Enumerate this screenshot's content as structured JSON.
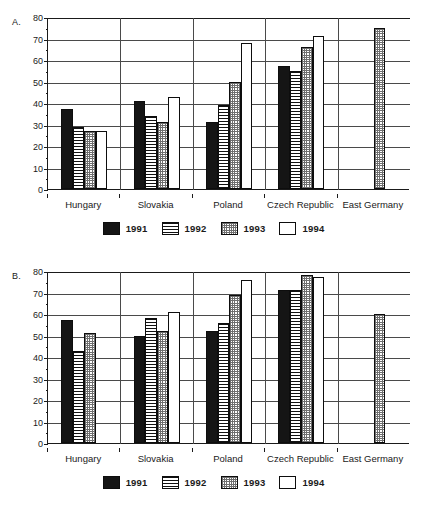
{
  "figure": {
    "background": "#ffffff",
    "panels": [
      {
        "label": "A.",
        "name": "panel-a"
      },
      {
        "label": "B.",
        "name": "panel-b"
      }
    ]
  },
  "legend": {
    "position": "bottom-center",
    "entries": [
      {
        "label": "1991",
        "pattern": "solid-black",
        "color": "#151515"
      },
      {
        "label": "1992",
        "pattern": "horizontal-stripes",
        "color": "#111111"
      },
      {
        "label": "1993",
        "pattern": "checkered-gray",
        "color": "#6e6e6e"
      },
      {
        "label": "1994",
        "pattern": "white-empty",
        "color": "#ffffff"
      }
    ]
  },
  "chart_data": [
    {
      "type": "bar",
      "name": "panel-a",
      "title": "A.",
      "xlabel": "",
      "ylabel": "",
      "ylim": [
        0,
        80
      ],
      "yticks": [
        0,
        10,
        20,
        30,
        40,
        50,
        60,
        70,
        80
      ],
      "ytick_labels": [
        "0",
        "10",
        "20",
        "30",
        "40",
        "50",
        "60",
        "70",
        "80"
      ],
      "grid": true,
      "categories": [
        "Hungary",
        "Slovakia",
        "Poland",
        "Czech Republic",
        "East Germany"
      ],
      "series": [
        {
          "name": "1991",
          "values": [
            37,
            41,
            31,
            57,
            null
          ]
        },
        {
          "name": "1992",
          "values": [
            29,
            34,
            39,
            55,
            null
          ]
        },
        {
          "name": "1993",
          "values": [
            27,
            31,
            50,
            66,
            75
          ]
        },
        {
          "name": "1994",
          "values": [
            27,
            43,
            68,
            71,
            null
          ]
        }
      ]
    },
    {
      "type": "bar",
      "name": "panel-b",
      "title": "B.",
      "xlabel": "",
      "ylabel": "",
      "ylim": [
        0,
        80
      ],
      "yticks": [
        0,
        10,
        20,
        30,
        40,
        50,
        60,
        70,
        80
      ],
      "ytick_labels": [
        "0",
        "10",
        "20",
        "30",
        "40",
        "50",
        "60",
        "70",
        "80"
      ],
      "grid": true,
      "categories": [
        "Hungary",
        "Slovakia",
        "Poland",
        "Czech Republic",
        "East Germany"
      ],
      "series": [
        {
          "name": "1991",
          "values": [
            57,
            50,
            52,
            71,
            null
          ]
        },
        {
          "name": "1992",
          "values": [
            43,
            58,
            56,
            71,
            null
          ]
        },
        {
          "name": "1993",
          "values": [
            51,
            52,
            69,
            78,
            60
          ]
        },
        {
          "name": "1994",
          "values": [
            null,
            61,
            76,
            77,
            null
          ]
        }
      ]
    }
  ]
}
